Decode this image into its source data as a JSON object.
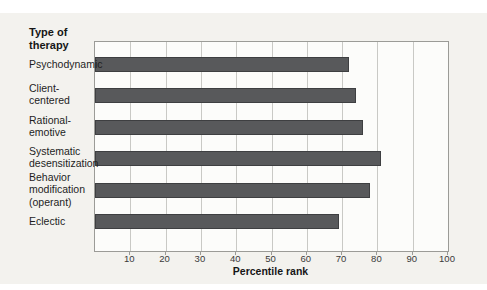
{
  "figure": {
    "y_axis_title_lines": [
      "Type of",
      "therapy"
    ]
  },
  "colors": {
    "figure_bg": "#f3f2ee",
    "plot_bg": "#fcfcfa",
    "plot_frame": "#9b9b97",
    "gridline": "#c9c9c5",
    "bar_fill": "#58595b",
    "bar_border": "#3e3f41",
    "tick": "#8f8f8b"
  },
  "chart_data": {
    "type": "bar",
    "orientation": "horizontal",
    "title": "",
    "ylabel_lines": [
      "Type of",
      "therapy"
    ],
    "xlabel": "Percentile rank",
    "categories": [
      [
        "Psychodynamic"
      ],
      [
        "Client-",
        "centered"
      ],
      [
        "Rational-",
        "emotive"
      ],
      [
        "Systematic",
        "desensitization"
      ],
      [
        "Behavior",
        "modification",
        "(operant)"
      ],
      [
        "Eclectic"
      ]
    ],
    "values": [
      72,
      74,
      76,
      81,
      78,
      69
    ],
    "xlim": [
      0,
      100
    ],
    "xticks": [
      10,
      20,
      30,
      40,
      50,
      60,
      70,
      80,
      90,
      100
    ],
    "grid": true,
    "legend": "none"
  }
}
